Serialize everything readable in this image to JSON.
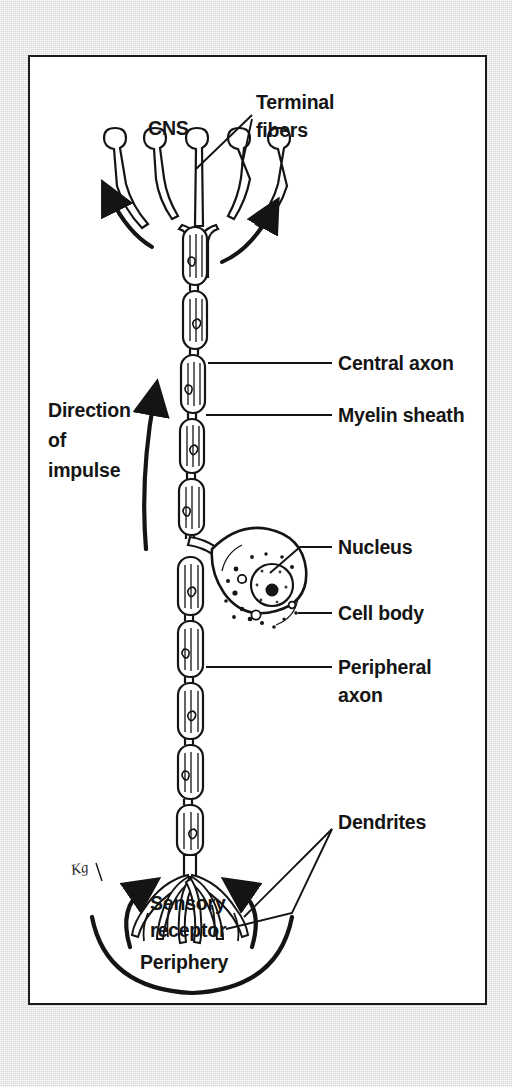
{
  "figure": {
    "kind": "sensory-neuron-anatomy-diagram",
    "panel_background": "#ffffff",
    "ink_color": "#141414",
    "page_background": "#e7e7e7",
    "signature": "Kg"
  },
  "labels": {
    "cns": "CNS",
    "terminal_fibers_line1": "Terminal",
    "terminal_fibers_line2": "fibers",
    "direction_line1": "Direction",
    "direction_line2": "of",
    "direction_line3": "impulse",
    "central_axon": "Central axon",
    "myelin_sheath": "Myelin sheath",
    "nucleus": "Nucleus",
    "cell_body": "Cell body",
    "peripheral_axon_line1": "Peripheral",
    "peripheral_axon_line2": "axon",
    "dendrites": "Dendrites",
    "sensory_line1": "Sensory",
    "sensory_line2": "receptor",
    "periphery": "Periphery"
  },
  "structures": [
    {
      "name": "terminal-fibers",
      "count": 5,
      "description": "branching fibers with bulbous end knobs at the CNS"
    },
    {
      "name": "central-axon",
      "description": "myelinated axon segment above the cell body"
    },
    {
      "name": "myelin-sheath",
      "description": "chain of Schwann cell capsules separated by nodes of Ranvier"
    },
    {
      "name": "cell-body",
      "description": "pear-shaped soma offset to the right of the axon"
    },
    {
      "name": "nucleus",
      "description": "round nucleus with dark nucleolus inside the cell body"
    },
    {
      "name": "peripheral-axon",
      "description": "myelinated axon segment below the cell body"
    },
    {
      "name": "dendrites",
      "description": "root-like branching terminals at the sensory receptor"
    },
    {
      "name": "periphery-arc",
      "description": "thick arc marking the body periphery"
    }
  ],
  "arrows": [
    {
      "name": "impulse-direction-arrow",
      "direction": "up"
    },
    {
      "name": "cns-output-arrow-left",
      "direction": "up-left"
    },
    {
      "name": "cns-output-arrow-right",
      "direction": "up-right"
    },
    {
      "name": "dendrite-input-arrow-left",
      "direction": "up-right"
    },
    {
      "name": "dendrite-input-arrow-right",
      "direction": "up-left"
    }
  ]
}
